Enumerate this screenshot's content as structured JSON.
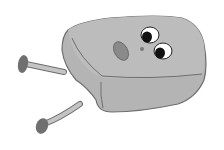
{
  "image": {
    "subject": "cartoon gray box character with eyes and legs",
    "colors": {
      "background": "#ffffff",
      "body": "#b4b4b4",
      "body_top": "#bcbcbc",
      "outline": "#6e6e6e",
      "feet": "#707070",
      "legs": "#c4c4c4",
      "pupil": "#111111",
      "eye_white": "#ffffff",
      "nose": "#8a8a8a"
    }
  }
}
